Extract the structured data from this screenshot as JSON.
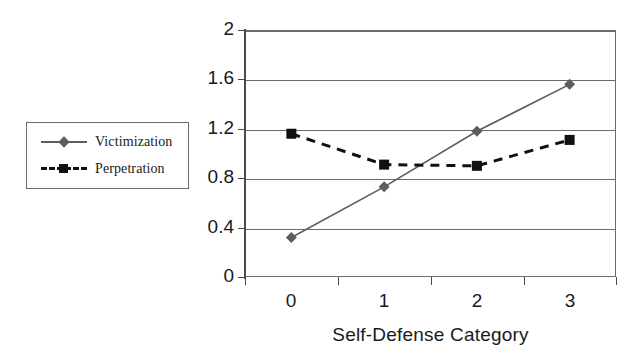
{
  "chart_data": {
    "type": "line",
    "title": "",
    "xlabel": "Self-Defense Category",
    "ylabel": "",
    "categories": [
      "0",
      "1",
      "2",
      "3"
    ],
    "ylim": [
      0,
      2
    ],
    "yticks": [
      0,
      0.4,
      0.8,
      1.2,
      1.6,
      2
    ],
    "ytick_labels": [
      "0",
      "0.4",
      "0.8",
      "1.2",
      "1.6",
      "2"
    ],
    "grid": "horizontal",
    "legend_position": "outside-left",
    "series": [
      {
        "name": "Victimization",
        "values": [
          0.32,
          0.73,
          1.18,
          1.56
        ],
        "color": "#5d5d5d",
        "line_style": "solid",
        "marker": "diamond"
      },
      {
        "name": "Perpetration",
        "values": [
          1.16,
          0.91,
          0.9,
          1.11
        ],
        "color": "#111111",
        "line_style": "dashed",
        "marker": "square"
      }
    ]
  },
  "legend": {
    "items": [
      {
        "label": "Victimization"
      },
      {
        "label": "Perpetration"
      }
    ]
  },
  "axes": {
    "x_title": "Self-Defense Category",
    "x_tick_labels": [
      "0",
      "1",
      "2",
      "3"
    ],
    "y_tick_labels": [
      "0",
      "0.4",
      "0.8",
      "1.2",
      "1.6",
      "2"
    ]
  },
  "colors": {
    "victimization": "#5d5d5d",
    "perpetration": "#111111",
    "axis": "#4a4a4a",
    "grid": "#6b6b6b",
    "background": "#ffffff"
  }
}
